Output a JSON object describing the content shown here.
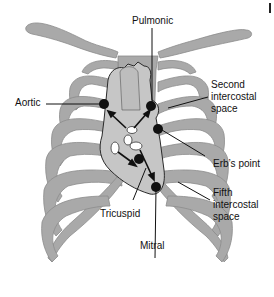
{
  "diagram": {
    "colors": {
      "bone": "#a9a9a9",
      "bone_stroke": "#8c8c8c",
      "heart": "#c8c8c8",
      "heart_stroke": "#333333",
      "point": "#111111",
      "line": "#111111"
    },
    "labels": {
      "pulmonic": "Pulmonic",
      "aortic": "Aortic",
      "second_intercostal": "Second\nintercostal\nspace",
      "erbs_point": "Erb’s point",
      "fifth_intercostal": "Fifth\nintercostal\nspace",
      "tricuspid": "Tricuspid",
      "mitral": "Mitral"
    }
  }
}
